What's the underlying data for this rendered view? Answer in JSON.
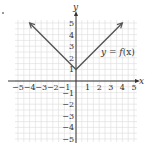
{
  "chart_data": {
    "type": "line",
    "title": "",
    "xlabel": "x",
    "ylabel": "y",
    "xlim": [
      -5,
      5
    ],
    "ylim": [
      -5,
      5
    ],
    "grid": true,
    "x_ticks": [
      -5,
      -4,
      -3,
      -2,
      -1,
      1,
      2,
      3,
      4,
      5
    ],
    "y_ticks": [
      -5,
      -4,
      -3,
      -2,
      -1,
      1,
      2,
      3,
      4,
      5
    ],
    "x_tick_labels": [
      "−5",
      "−4",
      "−3",
      "−2",
      "−1",
      "1",
      "2",
      "3",
      "4",
      "5"
    ],
    "y_tick_labels": [
      "−5",
      "−4",
      "−3",
      "−2",
      "−1",
      "1",
      "2",
      "3",
      "4",
      "5"
    ],
    "series": [
      {
        "name": "y = f(x)",
        "x": [
          -4,
          0,
          4
        ],
        "y": [
          5,
          1,
          5
        ],
        "arrows_at_ends": true
      }
    ],
    "annotations": [
      {
        "text": "y = f(x)",
        "x": 2.9,
        "y": 2.5
      }
    ],
    "colors": {
      "curve": "#555555",
      "axis": "#333333",
      "grid": "#dcdcdc"
    }
  },
  "labels": {
    "x_axis": "x",
    "y_axis": "y",
    "func_y": "y",
    "func_eq": " = ",
    "func_f": "f",
    "func_paren": "(x)"
  }
}
